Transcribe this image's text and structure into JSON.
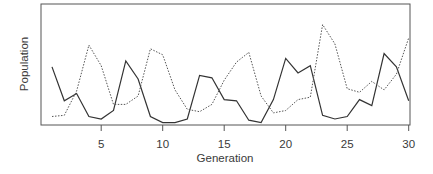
{
  "chart_data": {
    "type": "line",
    "title": "",
    "xlabel": "Generation",
    "ylabel": "Population",
    "xlim": [
      1,
      30
    ],
    "ylim": [
      0,
      100
    ],
    "x_ticks": [
      5,
      10,
      15,
      20,
      25,
      30
    ],
    "y_ticks": [],
    "grid": false,
    "legend": null,
    "x": [
      1,
      2,
      3,
      4,
      5,
      6,
      7,
      8,
      9,
      10,
      11,
      12,
      13,
      14,
      15,
      16,
      17,
      18,
      19,
      20,
      21,
      22,
      23,
      24,
      25,
      26,
      27,
      28,
      29,
      30
    ],
    "series": [
      {
        "name": "solid",
        "style": "solid",
        "color": "#333333",
        "values": [
          48,
          20,
          26,
          7,
          5,
          12,
          53,
          38,
          7,
          2,
          2,
          5,
          41,
          39,
          21,
          20,
          4,
          2,
          21,
          55,
          43,
          49,
          8,
          5,
          7,
          21,
          16,
          59,
          48,
          20
        ]
      },
      {
        "name": "dotted",
        "style": "dotted",
        "color": "#555555",
        "values": [
          7,
          8,
          28,
          66,
          49,
          17,
          17,
          24,
          63,
          58,
          29,
          13,
          11,
          17,
          37,
          52,
          60,
          24,
          10,
          12,
          21,
          23,
          83,
          67,
          30,
          27,
          36,
          29,
          42,
          72
        ]
      }
    ],
    "note": "Y axis has no tick labels; values are relative (0-100) estimates read from pixel positions."
  },
  "plot": {
    "x_label": "Generation",
    "y_label": "Population",
    "x_tick_labels": [
      "5",
      "10",
      "15",
      "20",
      "25",
      "30"
    ]
  }
}
